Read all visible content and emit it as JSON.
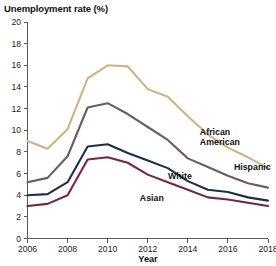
{
  "chart_data": {
    "type": "line",
    "title": "Unemployment rate (%)",
    "xlabel": "Year",
    "ylabel": "",
    "xlim": [
      2006,
      2018
    ],
    "ylim": [
      0,
      20
    ],
    "xticks": [
      "2006",
      "2008",
      "2010",
      "2012",
      "2014",
      "2016",
      "2018"
    ],
    "yticks": [
      "0",
      "2",
      "4",
      "6",
      "8",
      "10",
      "12",
      "14",
      "16",
      "18",
      "20"
    ],
    "grid": false,
    "legend_position": "inline-right",
    "x": [
      2006,
      2007,
      2008,
      2009,
      2010,
      2011,
      2012,
      2013,
      2014,
      2015,
      2016,
      2017,
      2018
    ],
    "series": [
      {
        "name": "African American",
        "color": "#d3b182",
        "values": [
          9.0,
          8.3,
          10.1,
          14.8,
          16.0,
          15.9,
          13.8,
          13.1,
          11.3,
          9.6,
          8.4,
          7.5,
          6.5
        ],
        "label_x": 2014.6,
        "label_y": 9.6
      },
      {
        "name": "Hispanic",
        "color": "#6b5d5a",
        "values": [
          5.2,
          5.6,
          7.6,
          12.1,
          12.5,
          11.5,
          10.3,
          9.1,
          7.4,
          6.6,
          5.8,
          5.1,
          4.7
        ],
        "label_x": 2016.3,
        "label_y": 6.3
      },
      {
        "name": "White",
        "color": "#1b2f4a",
        "values": [
          4.0,
          4.1,
          5.2,
          8.5,
          8.7,
          7.9,
          7.2,
          6.5,
          5.3,
          4.5,
          4.3,
          3.8,
          3.5
        ],
        "label_x": 2014.2,
        "label_y": 5.5
      },
      {
        "name": "Asian",
        "color": "#7a2540",
        "values": [
          3.0,
          3.2,
          4.0,
          7.3,
          7.5,
          7.0,
          5.9,
          5.2,
          4.5,
          3.8,
          3.6,
          3.3,
          3.0
        ],
        "label_x": 2012.8,
        "label_y": 3.5
      }
    ]
  }
}
